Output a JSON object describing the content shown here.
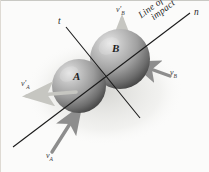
{
  "figure": {
    "background_color": "#fbfbfa",
    "bodies": [
      {
        "id": "A",
        "label": "A",
        "label_x": 73,
        "label_y": 76,
        "center_x": 79,
        "center_y": 86,
        "radius": 27,
        "fill_light": "#d3d3d3",
        "fill_mid": "#9a9a9a",
        "fill_dark": "#555555"
      },
      {
        "id": "B",
        "label": "B",
        "label_x": 112,
        "label_y": 48,
        "center_x": 120,
        "center_y": 59,
        "radius": 30,
        "fill_light": "#d8d8d8",
        "fill_mid": "#9f9f9f",
        "fill_dark": "#4f4f4f"
      }
    ],
    "axes": [
      {
        "id": "line-of-impact",
        "label": "n",
        "label_x": 195,
        "label_y": 12,
        "x1": 13,
        "y1": 147,
        "x2": 190,
        "y2": 13,
        "color": "#1a1a1a",
        "width": 1.1
      },
      {
        "id": "tangent-axis",
        "label": "t",
        "label_x": 60,
        "label_y": 22,
        "x1": 66,
        "y1": 27,
        "x2": 140,
        "y2": 118,
        "color": "#1a1a1a",
        "width": 1.1
      }
    ],
    "impact_label": {
      "line1": "Line of",
      "line2": "impact",
      "x": 141,
      "y": 14,
      "rotation_deg": -36
    },
    "vectors": [
      {
        "id": "v-A",
        "label": "v",
        "sub": "A",
        "prime": "",
        "label_x": 48,
        "label_y": 155,
        "x1": 52,
        "y1": 152,
        "x2": 80,
        "y2": 108,
        "color": "#8d8d8d",
        "width": 3.4,
        "head": "end"
      },
      {
        "id": "v-B",
        "label": "v",
        "sub": "B",
        "prime": "",
        "label_x": 171,
        "label_y": 73,
        "x1": 168,
        "y1": 75,
        "x2": 132,
        "y2": 62,
        "color": "#8d8d8d",
        "width": 3.4,
        "head": "end"
      },
      {
        "id": "v-A-prime",
        "label": "v",
        "sub": "A",
        "prime": "′",
        "label_x": 22,
        "label_y": 84,
        "x1": 70,
        "y1": 93,
        "x2": 25,
        "y2": 96,
        "color": "#c6c6c1",
        "width": 3.6,
        "head": "end"
      },
      {
        "id": "v-B-prime",
        "label": "v",
        "sub": "B",
        "prime": "′",
        "label_x": 117,
        "label_y": 8,
        "x1": 122,
        "y1": 62,
        "x2": 122,
        "y2": 20,
        "color": "#c9c9c3",
        "width": 3.6,
        "head": "end"
      }
    ]
  }
}
